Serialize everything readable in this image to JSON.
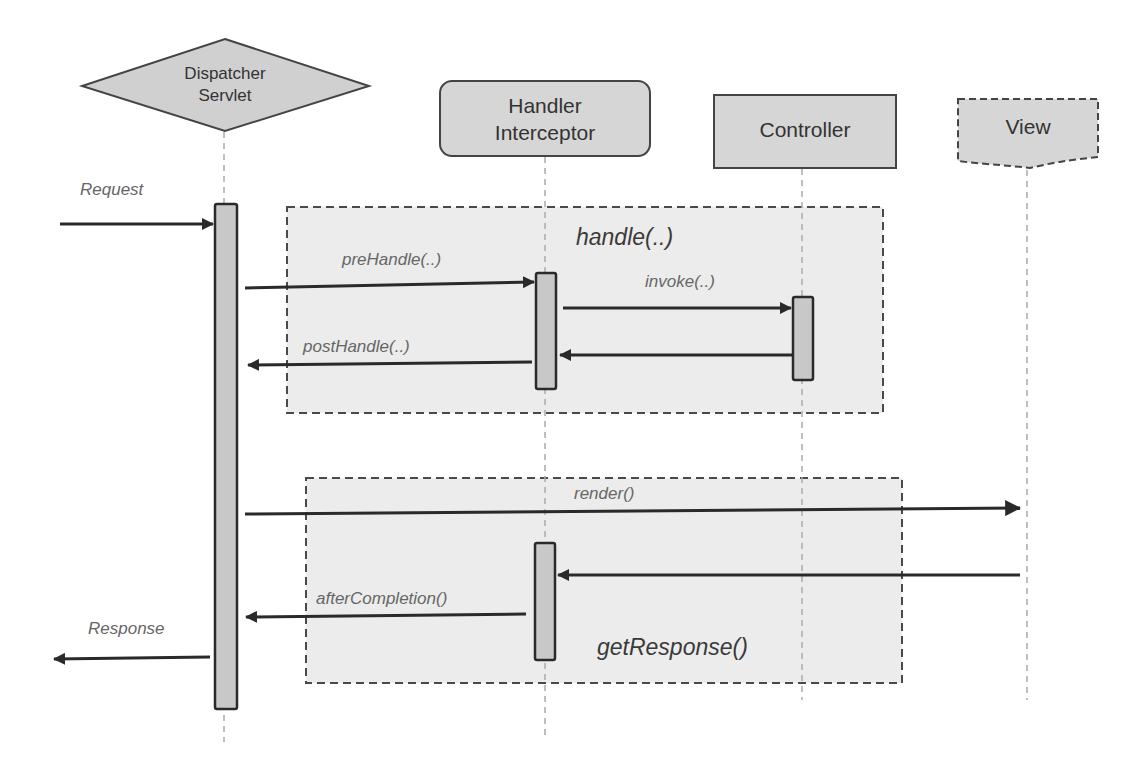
{
  "diagram": {
    "type": "sequence",
    "participants": [
      {
        "id": "dispatcher",
        "line1": "Dispatcher",
        "line2": "Servlet",
        "shape": "diamond"
      },
      {
        "id": "interceptor",
        "line1": "Handler",
        "line2": "Interceptor",
        "shape": "rounded-rect"
      },
      {
        "id": "controller",
        "line1": "Controller",
        "line2": "",
        "shape": "rect"
      },
      {
        "id": "view",
        "line1": "View",
        "line2": "",
        "shape": "document-dashed"
      }
    ],
    "frames": [
      {
        "id": "handle",
        "label": "handle(..)"
      },
      {
        "id": "getresponse",
        "label": "getResponse()"
      }
    ],
    "messages": [
      {
        "id": "request",
        "label": "Request",
        "from": "external",
        "to": "dispatcher"
      },
      {
        "id": "prehandle",
        "label": "preHandle(..)",
        "from": "dispatcher",
        "to": "interceptor"
      },
      {
        "id": "invoke",
        "label": "invoke(..)",
        "from": "interceptor",
        "to": "controller"
      },
      {
        "id": "invoke-return",
        "label": "",
        "from": "controller",
        "to": "interceptor"
      },
      {
        "id": "posthandle",
        "label": "postHandle(..)",
        "from": "interceptor",
        "to": "dispatcher"
      },
      {
        "id": "render",
        "label": "render()",
        "from": "dispatcher",
        "to": "view"
      },
      {
        "id": "view-return",
        "label": "",
        "from": "view",
        "to": "interceptor"
      },
      {
        "id": "aftercompletion",
        "label": "afterCompletion()",
        "from": "interceptor",
        "to": "dispatcher"
      },
      {
        "id": "response",
        "label": "Response",
        "from": "dispatcher",
        "to": "external"
      }
    ],
    "colors": {
      "shape_fill": "#d6d6d6",
      "frame_fill": "#ececec",
      "stroke": "#333333",
      "lifeline": "#aaaaaa"
    }
  }
}
